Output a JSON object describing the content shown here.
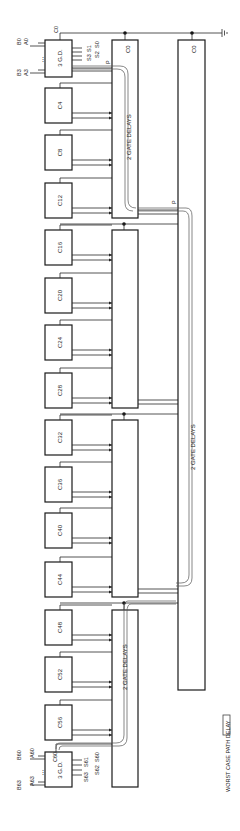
{
  "diagram": {
    "orientation": "rotated 90 degrees (reads bottom-to-top)",
    "first_group": {
      "label": "3 G.D.",
      "carry_in": "C0",
      "inputs_a": [
        "A0",
        "A3"
      ],
      "inputs_b": [
        "B0",
        "B3"
      ],
      "sums": [
        "S0",
        "S1",
        "S2",
        "S3"
      ],
      "outputs": [
        "P",
        "G"
      ]
    },
    "groups": [
      {
        "label": "C4"
      },
      {
        "label": "C8"
      },
      {
        "label": "C12"
      },
      {
        "label": "C16"
      },
      {
        "label": "C20"
      },
      {
        "label": "C24"
      },
      {
        "label": "C28"
      },
      {
        "label": "C32"
      },
      {
        "label": "C36"
      },
      {
        "label": "C40"
      },
      {
        "label": "C44"
      },
      {
        "label": "C48"
      },
      {
        "label": "C52"
      },
      {
        "label": "C56"
      }
    ],
    "last_group": {
      "label": "3 G.D.",
      "carry_in": "C60",
      "inputs_a": [
        "A60",
        "A63"
      ],
      "inputs_b": [
        "B60",
        "B63"
      ],
      "sums": [
        "S60",
        "S61",
        "S62",
        "S63"
      ]
    },
    "lookahead_units": [
      {
        "carry_label": "C0",
        "delay_label": "2 GATE DELAYS"
      },
      {
        "carry_label": "",
        "delay_label": ""
      },
      {
        "carry_label": "",
        "delay_label": ""
      },
      {
        "carry_label": "",
        "delay_label": "2 GATE DELAYS"
      }
    ],
    "second_level_unit": {
      "carry_label": "C0",
      "delay_label": "2 GATE DELAYS",
      "inputs": [
        "P",
        "G"
      ]
    },
    "signals": {
      "p_label": "P",
      "g_label": "G",
      "p2_label": "P",
      "g2_label": "G"
    },
    "legend": {
      "label": "WORST CASE PATH DELAY"
    },
    "colors": {
      "line": "#1a1a1a",
      "background": "#ffffff"
    }
  }
}
